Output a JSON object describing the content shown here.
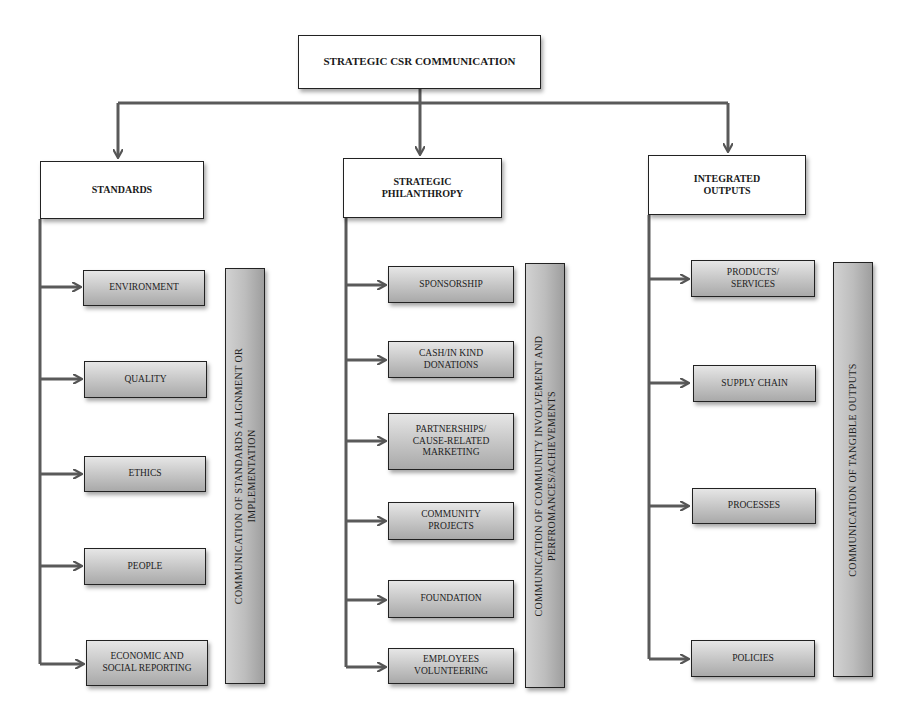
{
  "diagram": {
    "title": "STRATEGIC CSR COMMUNICATION",
    "colors": {
      "line": "#555555",
      "box_border": "#222222",
      "item_fill_top": "#e6e6e6",
      "item_fill_bottom": "#a9a9a9"
    },
    "columns": [
      {
        "heading": "STANDARDS",
        "items": [
          "ENVIRONMENT",
          "QUALITY",
          "ETHICS",
          "PEOPLE",
          "ECONOMIC AND SOCIAL REPORTING"
        ],
        "side_bar": "COMMUNICATION OF STANDARDS ALIGNMENT OR IMPLEMENTATION",
        "side_bar_lines": [
          "COMMUNICATION OF STANDARDS ALIGNMENT OR",
          "IMPLEMENTATION"
        ]
      },
      {
        "heading": "STRATEGIC PHILANTHROPY",
        "items": [
          "SPONSORSHIP",
          "CASH/IN KIND DONATIONS",
          "PARTNERSHIPS/ CAUSE-RELATED MARKETING",
          "COMMUNITY PROJECTS",
          "FOUNDATION",
          "EMPLOYEES VOLUNTEERING"
        ],
        "side_bar": "COMMUNICATION OF COMMUNITY INVOLVEMENT AND PERFROMANCES/ACHIEVEMENTS",
        "side_bar_lines": [
          "COMMUNICATION OF COMMUNITY INVOLVEMENT AND",
          "PERFROMANCES/ACHIEVEMENTS"
        ]
      },
      {
        "heading": "INTEGRATED OUTPUTS",
        "items": [
          "PRODUCTS/ SERVICES",
          "SUPPLY CHAIN",
          "PROCESSES",
          "POLICIES"
        ],
        "side_bar": "COMMUNICATION OF TANGIBLE OUTPUTS",
        "side_bar_lines": [
          "COMMUNICATION OF TANGIBLE OUTPUTS"
        ]
      }
    ]
  }
}
